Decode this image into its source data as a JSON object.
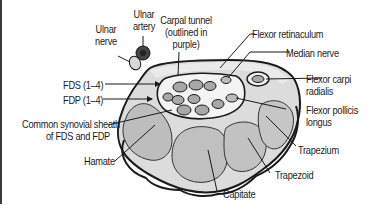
{
  "figure": {
    "type": "anatomical cross-section"
  },
  "labels": {
    "ulnar_nerve": [
      "Ulnar",
      "nerve"
    ],
    "ulnar_artery": [
      "Ulnar",
      "artery"
    ],
    "carpal_tunnel": [
      "Carpal tunnel",
      "(outlined in",
      "purple)"
    ],
    "flexor_retinaculum": "Flexor retinaculum",
    "median_nerve": "Median nerve",
    "flexor_carpi_radialis": [
      "Flexor carpi",
      "radialis"
    ],
    "fds": "FDS (1–4)",
    "fdp": "FDP (1–4)",
    "flexor_pollicis_longus": [
      "Flexor pollicis",
      "longus"
    ],
    "common_synovial_sheath": [
      "Common synovial sheath",
      "of FDS and FDP"
    ],
    "hamate": "Hamate",
    "trapezium": "Trapezium",
    "trapezoid": "Trapezoid",
    "capitate": "Capitate"
  },
  "colors": {
    "bone_fill": "#b9b9b9",
    "bone_outer": "#dcdcdc",
    "outline": "#1a1a1a",
    "tendon_fill": "#a8a8a8",
    "tunnel_bg": "#f1f1f1",
    "border": "#3a3a3a"
  }
}
